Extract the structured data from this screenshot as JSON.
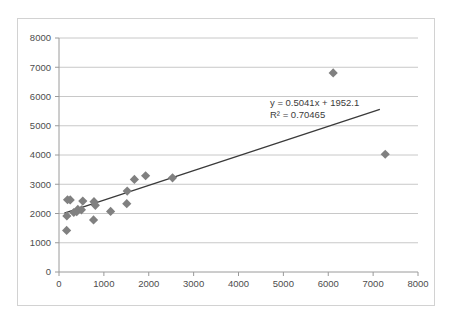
{
  "chart_data": {
    "type": "scatter",
    "title": "",
    "xlabel": "",
    "ylabel": "",
    "xlim": [
      0,
      8000
    ],
    "ylim": [
      0,
      8000
    ],
    "xticks": [
      0,
      1000,
      2000,
      3000,
      4000,
      5000,
      6000,
      7000,
      8000
    ],
    "yticks": [
      0,
      1000,
      2000,
      3000,
      4000,
      5000,
      6000,
      7000,
      8000
    ],
    "xtick_labels": [
      "0",
      "1000",
      "2000",
      "3000",
      "4000",
      "5000",
      "6000",
      "7000",
      "8000"
    ],
    "ytick_labels": [
      "0",
      "1000",
      "2000",
      "3000",
      "4000",
      "5000",
      "6000",
      "7000",
      "8000"
    ],
    "grid": "horizontal",
    "legend": "none",
    "marker_shape": "diamond",
    "marker_color": "#808080",
    "trendline_color": "#3a3a3a",
    "points": [
      {
        "x": 170,
        "y": 1420
      },
      {
        "x": 175,
        "y": 1915
      },
      {
        "x": 190,
        "y": 2470
      },
      {
        "x": 250,
        "y": 2465
      },
      {
        "x": 330,
        "y": 2035
      },
      {
        "x": 395,
        "y": 2060
      },
      {
        "x": 420,
        "y": 2140
      },
      {
        "x": 500,
        "y": 2125
      },
      {
        "x": 530,
        "y": 2425
      },
      {
        "x": 770,
        "y": 1780
      },
      {
        "x": 780,
        "y": 2405
      },
      {
        "x": 810,
        "y": 2280
      },
      {
        "x": 1150,
        "y": 2070
      },
      {
        "x": 1510,
        "y": 2335
      },
      {
        "x": 1520,
        "y": 2765
      },
      {
        "x": 1680,
        "y": 3165
      },
      {
        "x": 1930,
        "y": 3290
      },
      {
        "x": 2530,
        "y": 3220
      },
      {
        "x": 6110,
        "y": 6805
      },
      {
        "x": 7270,
        "y": 4025
      }
    ],
    "trendline": {
      "slope": 0.5041,
      "intercept": 1952.1,
      "r_squared": 0.70465,
      "x_start": 120,
      "x_end": 7150,
      "equation_text": "y = 0.5041x + 1952.1",
      "r2_text": "R² = 0.70465"
    }
  },
  "annotations": {
    "equation": "y = 0.5041x + 1952.1",
    "r_squared": "R² = 0.70465"
  }
}
